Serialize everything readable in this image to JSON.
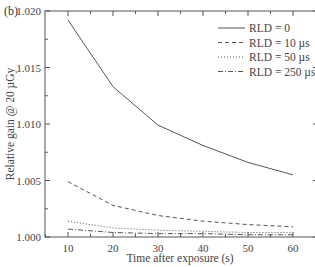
{
  "panel_label": "(b)",
  "chart_data": {
    "type": "line",
    "title": "",
    "xlabel": "Time after exposure (s)",
    "ylabel": "Relative gain @ 20 µGy",
    "x": [
      10,
      20,
      30,
      40,
      50,
      60
    ],
    "xlim": [
      5,
      65
    ],
    "ylim": [
      1.0,
      1.02
    ],
    "xticks": [
      10,
      20,
      30,
      40,
      50,
      60
    ],
    "yticks": [
      "1.000",
      "1.005",
      "1.010",
      "1.015",
      "1.020"
    ],
    "grid": false,
    "legend_position": "upper right",
    "series": [
      {
        "name": "RLD = 0",
        "style": "solid",
        "values": [
          1.0192,
          1.0133,
          1.0099,
          1.0081,
          1.0066,
          1.0055
        ]
      },
      {
        "name": "RLD = 10 µs",
        "style": "dashed",
        "values": [
          1.0049,
          1.0028,
          1.0019,
          1.0014,
          1.0011,
          1.0009
        ]
      },
      {
        "name": "RLD = 50 µs",
        "style": "dotted",
        "values": [
          1.0014,
          1.0008,
          1.0006,
          1.0005,
          1.0004,
          1.0004
        ]
      },
      {
        "name": "RLD = 250 µs",
        "style": "dash-dot",
        "values": [
          1.0007,
          1.0004,
          1.0003,
          1.0003,
          1.0002,
          1.0002
        ]
      }
    ]
  }
}
